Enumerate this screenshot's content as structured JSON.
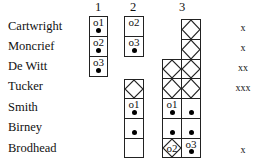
{
  "columns": [
    {
      "label": "1",
      "x": 89
    },
    {
      "label": "2",
      "x": 124
    },
    {
      "label": "3",
      "x": 171
    }
  ],
  "rows": [
    {
      "name": "Cartwright",
      "mark": "x"
    },
    {
      "name": "Moncrief",
      "mark": "x"
    },
    {
      "name": "De Witt",
      "mark": "xx"
    },
    {
      "name": "Tucker",
      "mark": "xxx"
    },
    {
      "name": "Smith",
      "mark": ""
    },
    {
      "name": "Birney",
      "mark": ""
    },
    {
      "name": "Brodhead",
      "mark": "x"
    }
  ],
  "cells": {
    "c1r0": {
      "label": "o1",
      "dot": true
    },
    "c1r1": {
      "label": "o2",
      "dot": true
    },
    "c1r2": {
      "label": "o3",
      "dot": true
    },
    "c2r0": {
      "label": "o2",
      "dot": false
    },
    "c2r1": {
      "label": "o3",
      "dot": true
    },
    "c2r3": {
      "crossed": true
    },
    "c2r4": {
      "label": "o1",
      "dot": true
    },
    "c2r5": {
      "dot": true
    },
    "c2r6": {
      "empty": true
    },
    "c3Rr0": {
      "crossed": true
    },
    "c3Rr1": {
      "crossed": true
    },
    "c3Lr2": {
      "crossed": true
    },
    "c3Rr2": {
      "crossed": true
    },
    "c3Lr3": {
      "crossed": true
    },
    "c3Rr3": {
      "crossed": true
    },
    "c3Lr4": {
      "label": "o1",
      "dot": true
    },
    "c3Rr4": {
      "dot": true
    },
    "c3Lr5": {
      "dot": true
    },
    "c3Rr5": {
      "dot": true
    },
    "c3Lr6": {
      "label": "o2",
      "crossed": true
    },
    "c3Rr6": {
      "label": "o3",
      "dot": true
    }
  }
}
